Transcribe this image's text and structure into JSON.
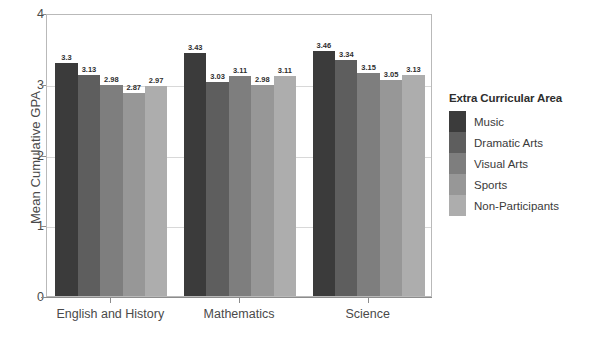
{
  "chart_data": {
    "type": "bar",
    "title": "",
    "xlabel": "",
    "ylabel": "Mean Cumulative GPA",
    "ylim": [
      0,
      4
    ],
    "yticks": [
      0,
      1,
      2,
      3,
      4
    ],
    "ytick_labels": [
      "0",
      "1",
      "2",
      "3",
      "4"
    ],
    "grid": true,
    "legend_position": "right",
    "legend_title": "Extra Curricular Area",
    "categories": [
      "English and History",
      "Mathematics",
      "Science"
    ],
    "series": [
      {
        "name": "Music",
        "color": "#3b3b3b",
        "values": [
          3.3,
          3.43,
          3.46
        ],
        "labels": [
          "3.3",
          "3.43",
          "3.46"
        ]
      },
      {
        "name": "Dramatic Arts",
        "color": "#5e5e5e",
        "values": [
          3.13,
          3.03,
          3.34
        ],
        "labels": [
          "3.13",
          "3.03",
          "3.34"
        ]
      },
      {
        "name": "Visual Arts",
        "color": "#7e7e7e",
        "values": [
          2.98,
          3.11,
          3.15
        ],
        "labels": [
          "2.98",
          "3.11",
          "3.15"
        ]
      },
      {
        "name": "Sports",
        "color": "#979797",
        "values": [
          2.87,
          2.98,
          3.05
        ],
        "labels": [
          "2.87",
          "2.98",
          "3.05"
        ]
      },
      {
        "name": "Non-Participants",
        "color": "#adadad",
        "values": [
          2.97,
          3.11,
          3.13
        ],
        "labels": [
          "2.97",
          "3.11",
          "3.13"
        ]
      }
    ]
  },
  "colors": {
    "axis": "#8c8c8c",
    "grid": "#d8d8d8",
    "frame": "#b9b9b9",
    "text": "#4a4a4a",
    "background": "#ffffff"
  }
}
